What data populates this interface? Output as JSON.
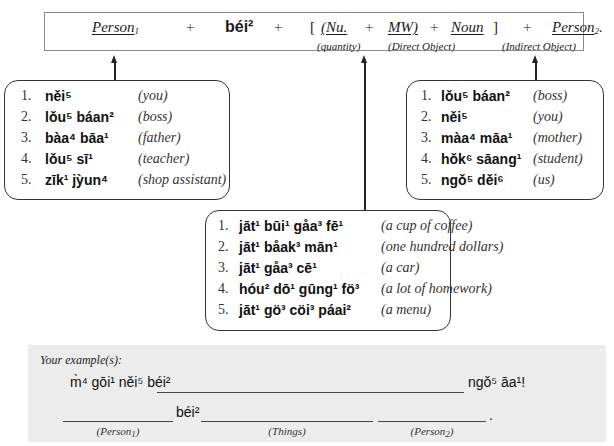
{
  "formula": {
    "person1": "Person",
    "person1_sub": "1",
    "plus": "+",
    "bei": "béi²",
    "bracket_open": "[",
    "nu": "(Nu.",
    "mw": "MW)",
    "noun": "Noun",
    "bracket_close": "]",
    "person2": "Person",
    "person2_sub": "2",
    "person2_period": ".",
    "label_quantity": "(quantity)",
    "label_direct_object": "(Direct Object)",
    "label_indirect_object": "(Indirect Object)"
  },
  "person1_list": {
    "items": [
      {
        "num": "1.",
        "word": "něi⁵",
        "gloss": "(you)"
      },
      {
        "num": "2.",
        "word": "lǒu⁵ báan²",
        "gloss": "(boss)"
      },
      {
        "num": "3.",
        "word": "bàa⁴ bāa¹",
        "gloss": "(father)"
      },
      {
        "num": "4.",
        "word": "lǒu⁵ sī¹",
        "gloss": "(teacher)"
      },
      {
        "num": "5.",
        "word": "zīk¹ jỳun⁴",
        "gloss": "(shop assistant)"
      }
    ]
  },
  "person2_list": {
    "items": [
      {
        "num": "1.",
        "word": "lǒu⁵ báan²",
        "gloss": "(boss)"
      },
      {
        "num": "2.",
        "word": "něi⁵",
        "gloss": "(you)"
      },
      {
        "num": "3.",
        "word": "màa⁴ māa¹",
        "gloss": "(mother)"
      },
      {
        "num": "4.",
        "word": "hǒk⁶ sāang¹",
        "gloss": "(student)"
      },
      {
        "num": "5.",
        "word": "ngǒ⁵ děi⁶",
        "gloss": "(us)"
      }
    ]
  },
  "object_list": {
    "items": [
      {
        "num": "1.",
        "word": "jāt¹ būi¹ gåa³ fē¹",
        "gloss": "(a cup of coffee)"
      },
      {
        "num": "2.",
        "word": "jāt¹ båak³ mān¹",
        "gloss": "(one hundred dollars)"
      },
      {
        "num": "3.",
        "word": "jāt¹ gåa³ cē¹",
        "gloss": "(a car)"
      },
      {
        "num": "4.",
        "word": "hóu² dō¹ gūng¹ fö³",
        "gloss": "(a lot of homework)"
      },
      {
        "num": "5.",
        "word": "jāt¹ gö³ cöi³ páai²",
        "gloss": "(a menu)"
      }
    ]
  },
  "practice": {
    "title": "Your example(s):",
    "line1_start": "m̀⁴ gōi¹ něi⁵ béi²",
    "line1_end": "ngǒ⁵ āa¹!",
    "line2_bei": "béi²",
    "line2_period": ".",
    "label_person1": "(Person",
    "label_person1_sub": "1",
    "label_things": "(Things)",
    "label_person2": "(Person",
    "label_person2_sub": "2",
    "label_close": ")"
  }
}
